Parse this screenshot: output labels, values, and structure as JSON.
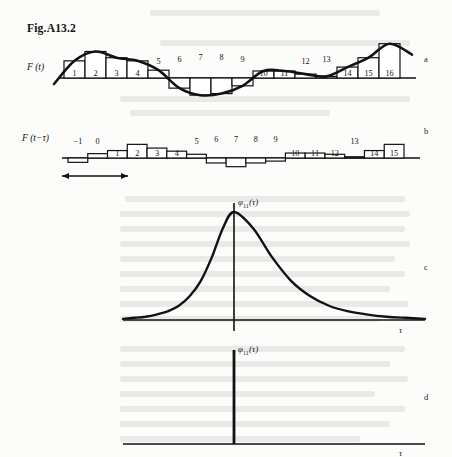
{
  "figure": {
    "title": "Fig.A13.2",
    "panel_letters": [
      "a",
      "b",
      "c",
      "d"
    ],
    "signal_label_a": "F (t)",
    "signal_label_b": "F (t−τ)",
    "phi_label_c": "φ",
    "phi_sub_c": "11",
    "phi_arg_c": "(τ)",
    "phi_label_d": "φ",
    "phi_sub_d": "11",
    "phi_arg_d": "(τ)",
    "tau_axis_label_c": "τ",
    "tau_axis_label_d": "τ",
    "shift_arrow_name": "time-shift-arrow",
    "ink_color": "#111111",
    "page_color": "#fcfcfb"
  },
  "chart_data": [
    {
      "type": "bar",
      "panel": "a",
      "title": "F(t) sampled signal with envelope",
      "xlabel": "t",
      "ylabel": "F (t)",
      "categories": [
        "1",
        "2",
        "3",
        "4",
        "5",
        "6",
        "7",
        "8",
        "9",
        "10",
        "11",
        "12",
        "13",
        "14",
        "15",
        "16"
      ],
      "values": [
        22,
        34,
        26,
        22,
        10,
        -13,
        -22,
        -20,
        -10,
        9,
        9,
        5,
        2,
        14,
        26,
        44
      ],
      "label_offsets": [
        0,
        0,
        0,
        0,
        12,
        14,
        16,
        16,
        14,
        0,
        0,
        12,
        14,
        0,
        0,
        0
      ],
      "ylim": [
        -30,
        52
      ],
      "grid": false,
      "envelope": "sinusoid-like smooth curve passing through bar tops"
    },
    {
      "type": "bar",
      "panel": "b",
      "title": "F(t−τ) shifted sampled signal",
      "xlabel": "t",
      "ylabel": "F (t−τ)",
      "categories": [
        "−1",
        "0",
        "1",
        "2",
        "3",
        "4",
        "5",
        "6",
        "7",
        "8",
        "9",
        "10",
        "11",
        "12",
        "13",
        "14",
        "15"
      ],
      "values": [
        -7,
        7,
        12,
        22,
        16,
        11,
        6,
        -8,
        -14,
        -8,
        -5,
        8,
        8,
        6,
        2,
        12,
        22
      ],
      "label_offsets": [
        12,
        12,
        0,
        0,
        0,
        0,
        12,
        14,
        14,
        14,
        14,
        0,
        0,
        0,
        12,
        0,
        0
      ],
      "ylim": [
        -20,
        28
      ],
      "grid": false
    },
    {
      "type": "line",
      "panel": "c",
      "title": "Autocorrelation of band-limited noise",
      "xlabel": "τ",
      "ylabel": "φ₁₁(τ)",
      "x": [
        -1.0,
        -0.9,
        -0.8,
        -0.7,
        -0.6,
        -0.5,
        -0.4,
        -0.3,
        -0.2,
        -0.1,
        0.0,
        0.1,
        0.2,
        0.3,
        0.4,
        0.5,
        0.6,
        0.7,
        0.8,
        0.9,
        1.0
      ],
      "y": [
        0.01,
        0.02,
        0.03,
        0.05,
        0.08,
        0.13,
        0.22,
        0.36,
        0.58,
        0.85,
        1.0,
        0.85,
        0.58,
        0.36,
        0.22,
        0.13,
        0.08,
        0.05,
        0.03,
        0.02,
        0.01
      ],
      "ylim": [
        0,
        1.05
      ],
      "xlim": [
        -1.05,
        1.05
      ],
      "grid": false,
      "shape": "symmetric exponential-like peak at tau = 0"
    },
    {
      "type": "line",
      "panel": "d",
      "title": "Autocorrelation of white noise (impulse)",
      "xlabel": "τ",
      "ylabel": "φ₁₁(τ)",
      "x": [
        0
      ],
      "y": [
        1.0
      ],
      "ylim": [
        0,
        1.05
      ],
      "xlim": [
        -1.05,
        1.05
      ],
      "grid": false,
      "shape": "dirac delta impulse at tau = 0"
    }
  ]
}
